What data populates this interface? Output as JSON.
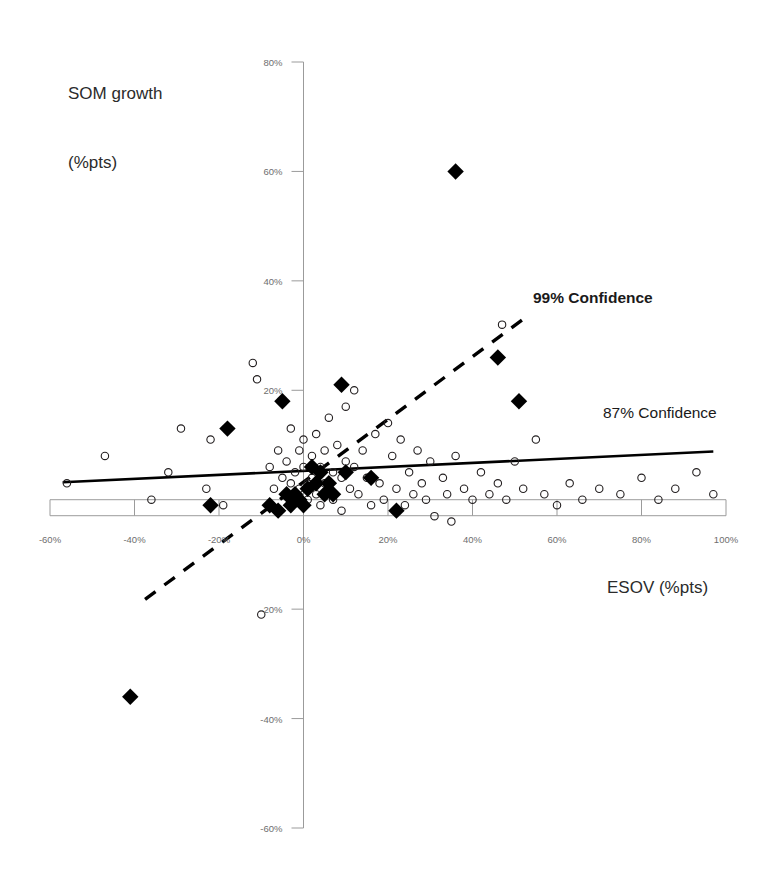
{
  "chart_data": {
    "type": "scatter",
    "title": "",
    "xlabel": "ESOV (%pts)",
    "ylabel": "SOM growth\n(%pts)",
    "ylabel_line1": "SOM growth",
    "ylabel_line2": "(%pts)",
    "xlim": [
      -60,
      100
    ],
    "ylim": [
      -60,
      80
    ],
    "grid": false,
    "legend_position": "inline-annotations",
    "xticks": [
      "-60%",
      "-40%",
      "-20%",
      "0%",
      "20%",
      "40%",
      "60%",
      "80%",
      "100%"
    ],
    "xtick_values": [
      -60,
      -40,
      -20,
      0,
      20,
      40,
      60,
      80,
      100
    ],
    "yticks": [
      "80%",
      "60%",
      "40%",
      "20%",
      "-20%",
      "-40%",
      "-60%"
    ],
    "ytick_values": [
      80,
      60,
      40,
      20,
      -20,
      -40,
      -60
    ],
    "annotations": [
      {
        "text": "99% Confidence",
        "bold": true,
        "x": 55,
        "y": 34
      },
      {
        "text": "87% Confidence",
        "bold": false,
        "x": 73,
        "y": 17
      }
    ],
    "series": [
      {
        "name": "open-circles",
        "marker": "open-circle",
        "color": "#231f20",
        "points": [
          [
            -56,
            3
          ],
          [
            -47,
            8
          ],
          [
            -36,
            0
          ],
          [
            -32,
            5
          ],
          [
            -29,
            13
          ],
          [
            -23,
            2
          ],
          [
            -22,
            11
          ],
          [
            -19,
            -1
          ],
          [
            -12,
            25
          ],
          [
            -11,
            22
          ],
          [
            -10,
            -21
          ],
          [
            -8,
            6
          ],
          [
            -7,
            2
          ],
          [
            -6,
            9
          ],
          [
            -5,
            4
          ],
          [
            -4,
            1
          ],
          [
            -4,
            7
          ],
          [
            -3,
            13
          ],
          [
            -3,
            3
          ],
          [
            -2,
            0
          ],
          [
            -2,
            5
          ],
          [
            -1,
            9
          ],
          [
            -1,
            2
          ],
          [
            0,
            6
          ],
          [
            0,
            11
          ],
          [
            1,
            3
          ],
          [
            1,
            0
          ],
          [
            2,
            8
          ],
          [
            2,
            4
          ],
          [
            3,
            1
          ],
          [
            3,
            12
          ],
          [
            4,
            6
          ],
          [
            4,
            -1
          ],
          [
            5,
            3
          ],
          [
            5,
            9
          ],
          [
            6,
            15
          ],
          [
            6,
            2
          ],
          [
            7,
            5
          ],
          [
            7,
            0
          ],
          [
            8,
            10
          ],
          [
            9,
            4
          ],
          [
            9,
            -2
          ],
          [
            10,
            7
          ],
          [
            10,
            17
          ],
          [
            11,
            2
          ],
          [
            12,
            6
          ],
          [
            12,
            20
          ],
          [
            13,
            1
          ],
          [
            14,
            9
          ],
          [
            15,
            4
          ],
          [
            16,
            -1
          ],
          [
            17,
            12
          ],
          [
            18,
            3
          ],
          [
            19,
            0
          ],
          [
            20,
            14
          ],
          [
            21,
            8
          ],
          [
            22,
            2
          ],
          [
            23,
            11
          ],
          [
            24,
            -1
          ],
          [
            25,
            5
          ],
          [
            26,
            1
          ],
          [
            27,
            9
          ],
          [
            28,
            3
          ],
          [
            29,
            0
          ],
          [
            30,
            7
          ],
          [
            31,
            -3
          ],
          [
            33,
            4
          ],
          [
            34,
            1
          ],
          [
            35,
            -4
          ],
          [
            36,
            8
          ],
          [
            38,
            2
          ],
          [
            40,
            0
          ],
          [
            42,
            5
          ],
          [
            44,
            1
          ],
          [
            46,
            3
          ],
          [
            48,
            0
          ],
          [
            50,
            7
          ],
          [
            52,
            2
          ],
          [
            55,
            11
          ],
          [
            57,
            1
          ],
          [
            60,
            -1
          ],
          [
            63,
            3
          ],
          [
            66,
            0
          ],
          [
            70,
            2
          ],
          [
            75,
            1
          ],
          [
            80,
            4
          ],
          [
            84,
            0
          ],
          [
            88,
            2
          ],
          [
            93,
            5
          ],
          [
            97,
            1
          ],
          [
            47,
            32
          ]
        ]
      },
      {
        "name": "filled-diamonds",
        "marker": "filled-diamond",
        "color": "#000000",
        "points": [
          [
            36,
            60
          ],
          [
            46,
            26
          ],
          [
            51,
            18
          ],
          [
            9,
            21
          ],
          [
            -5,
            18
          ],
          [
            -18,
            13
          ],
          [
            -22,
            -1
          ],
          [
            -41,
            -36
          ],
          [
            22,
            -2
          ],
          [
            16,
            4
          ],
          [
            10,
            5
          ],
          [
            4,
            5
          ],
          [
            1,
            2
          ],
          [
            0,
            -1
          ],
          [
            -1,
            0
          ],
          [
            -2,
            1
          ],
          [
            -3,
            -1
          ],
          [
            -4,
            1
          ],
          [
            2,
            6
          ],
          [
            3,
            3
          ],
          [
            -6,
            -2
          ],
          [
            -8,
            -1
          ],
          [
            5,
            1
          ],
          [
            6,
            3
          ],
          [
            7,
            1
          ]
        ]
      }
    ],
    "trendlines": [
      {
        "name": "87% Confidence",
        "style": "solid",
        "color": "#000000",
        "x0": -57,
        "y0": 3.2,
        "x1": 97,
        "y1": 8.8
      },
      {
        "name": "99% Confidence",
        "style": "dashed",
        "color": "#000000",
        "x0": -37.5,
        "y0": -18.2,
        "x1": 52,
        "y1": 33.0
      }
    ]
  },
  "axes": {
    "x_axis_label": "ESOV (%pts)",
    "y_axis_label_line1": "SOM growth",
    "y_axis_label_line2": "(%pts)"
  }
}
